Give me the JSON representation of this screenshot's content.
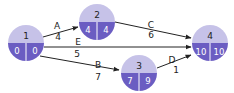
{
  "diagram": {
    "type": "activity-on-arrow network",
    "colors": {
      "node_top": "#c6c2e8",
      "node_bottom": "#6b5dc2",
      "edge": "#222222"
    },
    "nodes": [
      {
        "id": "1",
        "label": "1",
        "earliest": "0",
        "latest": "0"
      },
      {
        "id": "2",
        "label": "2",
        "earliest": "4",
        "latest": "4"
      },
      {
        "id": "3",
        "label": "3",
        "earliest": "7",
        "latest": "9"
      },
      {
        "id": "4",
        "label": "4",
        "earliest": "10",
        "latest": "10"
      }
    ],
    "edges": [
      {
        "from": "1",
        "to": "2",
        "activity": "A",
        "duration": "4"
      },
      {
        "from": "1",
        "to": "4",
        "activity": "E",
        "duration": "5"
      },
      {
        "from": "1",
        "to": "3",
        "activity": "B",
        "duration": "7"
      },
      {
        "from": "2",
        "to": "4",
        "activity": "C",
        "duration": "6"
      },
      {
        "from": "3",
        "to": "4",
        "activity": "D",
        "duration": "1"
      }
    ]
  }
}
